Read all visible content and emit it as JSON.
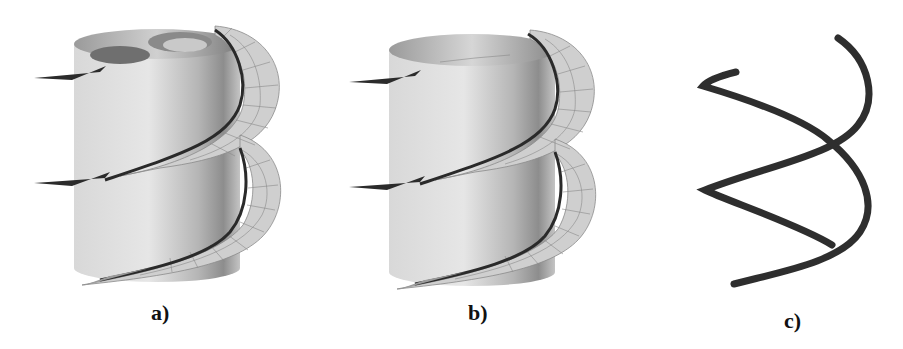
{
  "figure": {
    "panels": [
      {
        "id": "a",
        "label": "a)",
        "description": "Cylinder with helical blade surface and mesh, double inner cut at top"
      },
      {
        "id": "b",
        "label": "b)",
        "description": "Cylinder with helical blade surface and mesh"
      },
      {
        "id": "c",
        "label": "c)",
        "description": "Helical tube curve"
      }
    ],
    "colors": {
      "background": "#ffffff",
      "cylinder_light": "#e2e2e2",
      "cylinder_dark": "#8a8a8a",
      "blade_fill": "#cfcfcf",
      "mesh_line": "#7a7a7a",
      "tube": "#2e2e2e"
    }
  }
}
